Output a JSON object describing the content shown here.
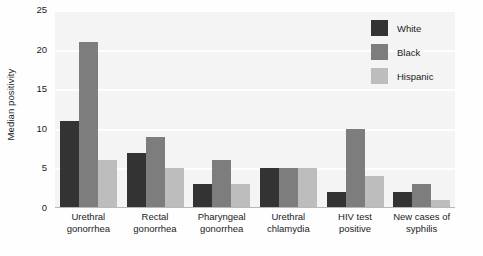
{
  "chart_data": {
    "type": "bar",
    "title": "",
    "subtitle": "",
    "xlabel": "",
    "ylabel": "Median positivity",
    "ylim": [
      0,
      25
    ],
    "yticks": [
      0,
      5,
      10,
      15,
      20,
      25
    ],
    "ytick_labels": [
      "0",
      "5",
      "10",
      "15",
      "20",
      "25"
    ],
    "grid": true,
    "grid_axis": "y",
    "legend_position": "top-right",
    "categories": [
      "Urethral gonorrhea",
      "Rectal gonorrhea",
      "Pharyngeal gonorrhea",
      "Urethral chlamydia",
      "HIV test positive",
      "New cases of syphilis"
    ],
    "category_lines": [
      [
        "Urethral",
        "gonorrhea"
      ],
      [
        "Rectal",
        "gonorrhea"
      ],
      [
        "Pharyngeal",
        "gonorrhea"
      ],
      [
        "Urethral",
        "chlamydia"
      ],
      [
        "HIV test",
        "positive"
      ],
      [
        "New cases of",
        "syphilis"
      ]
    ],
    "series": [
      {
        "name": "White",
        "color": "#333333",
        "values": [
          11,
          7,
          3,
          5,
          2,
          2
        ]
      },
      {
        "name": "Black",
        "color": "#7d7d7d",
        "values": [
          21,
          9,
          6,
          5,
          10,
          3
        ]
      },
      {
        "name": "Hispanic",
        "color": "#bdbdbd",
        "values": [
          6,
          5,
          3,
          5,
          4,
          1
        ]
      }
    ],
    "plot_background": "#f4f4f4",
    "gridline_color": "#ffffff",
    "axis_color": "#b8b8b8",
    "text_color": "#1c1c1c"
  },
  "legend": {
    "items": [
      {
        "label": "White",
        "color": "#333333",
        "swatch_name": "legend-swatch-white"
      },
      {
        "label": "Black",
        "color": "#7d7d7d",
        "swatch_name": "legend-swatch-black"
      },
      {
        "label": "Hispanic",
        "color": "#bdbdbd",
        "swatch_name": "legend-swatch-hispanic"
      }
    ]
  }
}
